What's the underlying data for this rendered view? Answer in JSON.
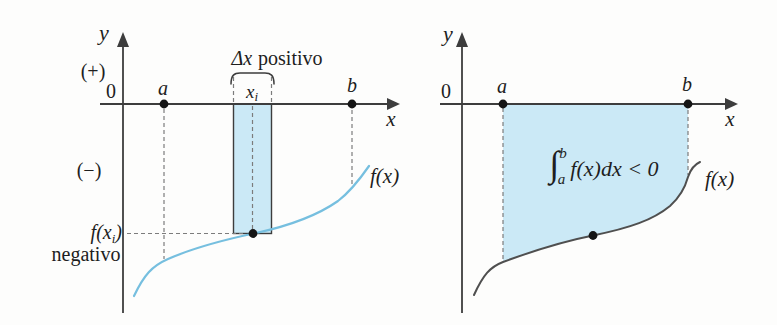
{
  "colors": {
    "fill": "#cbe9f6",
    "curve-left": "#76bfdf",
    "curve-right": "#4f4f4f",
    "axis": "#3d3d3d",
    "dash": "#7c7c7c",
    "text": "#1e1e1e",
    "dot": "#151515"
  },
  "left_graph": {
    "y_label": "y",
    "x_label": "x",
    "origin_label": "0",
    "plus_label": "(+)",
    "minus_label": "(−)",
    "a_label": "a",
    "b_label": "b",
    "xi_base": "x",
    "xi_sub": "i",
    "delta_math": "Δx",
    "delta_word": "positivo",
    "fxi_pre": "f(x",
    "fxi_sub": "i",
    "fxi_post": ")",
    "negativo_label": "negativo",
    "fx_label": "f(x)"
  },
  "right_graph": {
    "y_label": "y",
    "x_label": "x",
    "origin_label": "0",
    "a_label": "a",
    "b_label": "b",
    "integral_sign": "∫",
    "integral_sup": "b",
    "integral_sub": "a",
    "integral_body": "f(x)dx < 0",
    "fx_label": "f(x)"
  }
}
